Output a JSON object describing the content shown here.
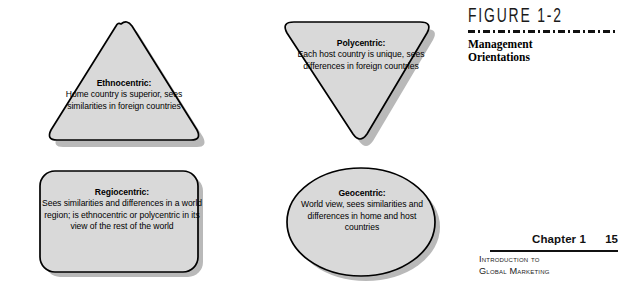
{
  "figure": {
    "number_label": "FIGURE 1-2",
    "title_line1": "Management",
    "title_line2": "Orientations",
    "rule_style": "dashed"
  },
  "shapes": [
    {
      "id": "ethnocentric",
      "shape_type": "triangle-up-rounded",
      "heading": "Ethnocentric:",
      "body": "Home country is superior, sees similarities in foreign countries",
      "fill": "#d9d9d9",
      "stroke": "#000000",
      "shadow": "#b3b3b3"
    },
    {
      "id": "polycentric",
      "shape_type": "triangle-down-rounded",
      "heading": "Polycentric:",
      "body": "Each host country is unique, sees differences in foreign countries",
      "fill": "#d9d9d9",
      "stroke": "#000000",
      "shadow": "#b3b3b3"
    },
    {
      "id": "regiocentric",
      "shape_type": "rounded-rectangle",
      "heading": "Regiocentric:",
      "body": "Sees similarities and differences in a world region; is ethnocentric or polycentric in its view of the rest of the world",
      "fill": "#d9d9d9",
      "stroke": "#000000",
      "shadow": "#b3b3b3"
    },
    {
      "id": "geocentric",
      "shape_type": "ellipse",
      "heading": "Geocentric:",
      "body": "World view, sees similarities and differences in home and host countries",
      "fill": "#d9d9d9",
      "stroke": "#000000",
      "shadow": "#b3b3b3"
    }
  ],
  "footer": {
    "chapter_label": "Chapter 1",
    "page_number": "15",
    "caption_line1": "Introduction to",
    "caption_line2": "Global Marketing"
  }
}
